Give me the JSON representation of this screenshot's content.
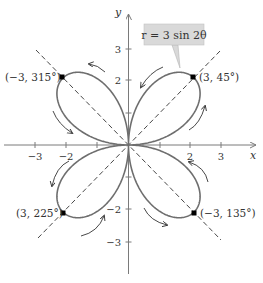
{
  "chart_data": {
    "type": "line",
    "subtype": "polar-rose",
    "title": "",
    "equation": "r = 3 sin 2θ",
    "xlabel": "x",
    "ylabel": "y",
    "xlim": [
      -3.5,
      4
    ],
    "ylim": [
      -4,
      4
    ],
    "grid": false,
    "x_ticks": [
      -3,
      -2,
      -1,
      1,
      2,
      3
    ],
    "x_tick_labels": [
      "−3",
      "−2",
      "",
      "",
      "2",
      "3"
    ],
    "y_ticks": [
      -3,
      -2,
      -1,
      1,
      2,
      3
    ],
    "y_tick_labels": [
      "−3",
      "−2",
      "",
      "",
      "2",
      "3"
    ],
    "series": [
      {
        "name": "r = 3 sin 2θ",
        "petals": 4,
        "amplitude": 3
      }
    ],
    "symmetry_lines": [
      "y = x",
      "y = −x"
    ],
    "annotated_points": [
      {
        "label": "(3, 45°)",
        "r": 3,
        "theta_deg": 45,
        "x": 2.12,
        "y": 2.12
      },
      {
        "label": "(−3, 315°)",
        "r": -3,
        "theta_deg": 315,
        "x": -2.12,
        "y": 2.12
      },
      {
        "label": "(3, 225°)",
        "r": 3,
        "theta_deg": 225,
        "x": -2.12,
        "y": -2.12
      },
      {
        "label": "(−3, 135°)",
        "r": -3,
        "theta_deg": 135,
        "x": 2.12,
        "y": -2.12
      }
    ],
    "annotations": [
      "direction arrows along each petal"
    ]
  },
  "labels": {
    "x_axis": "x",
    "y_axis": "y",
    "equation": "r = 3 sin 2θ",
    "pt_q1": "(3, 45°)",
    "pt_q2": "(−3, 315°)",
    "pt_q3": "(3, 225°)",
    "pt_q4": "(−3, 135°)",
    "xt_n3": "−3",
    "xt_n2": "−2",
    "xt_2": "2",
    "xt_3": "3",
    "yt_3": "3",
    "yt_2": "2",
    "yt_n2": "−2",
    "yt_n3": "−3"
  },
  "colors": {
    "curve": "#6e6e6e",
    "axis": "#7a7a7a",
    "dashed": "#333333",
    "label_box": "#d9d9d9",
    "point": "#000000"
  }
}
